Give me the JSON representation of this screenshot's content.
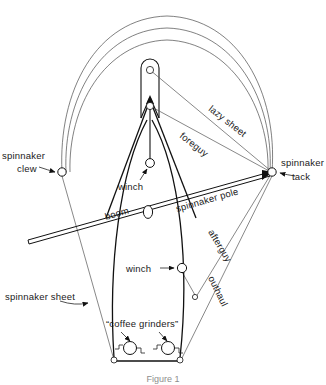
{
  "figure": {
    "caption": "Figure 1",
    "background_color": "#ffffff",
    "ink_color": "#111111",
    "line_color": "#555555"
  },
  "labels": {
    "spinnaker_clew": "spinnaker\nclew",
    "spinnaker_clew_line1": "spinnaker",
    "spinnaker_clew_line2": "clew",
    "spinnaker_tack_line1": "spinnaker",
    "spinnaker_tack_line2": "tack",
    "lazy_sheet": "lazy sheet",
    "foreguy": "foreguy",
    "winch_upper": "winch",
    "winch_lower": "winch",
    "boom": "boom",
    "spinnaker_pole": "spinnaker pole",
    "afterguy": "afterguy",
    "outhaul": "outhaul",
    "spinnaker_sheet": "spinnaker sheet",
    "coffee_grinders": "“coffee grinders”"
  },
  "nodes": [
    {
      "name": "spinnaker-clew-node",
      "x": 62,
      "y": 172,
      "r": 4.2
    },
    {
      "name": "spinnaker-tack-node",
      "x": 272,
      "y": 172,
      "r": 4.2
    },
    {
      "name": "mast-upper-ring",
      "x": 150,
      "y": 70,
      "r": 3.6
    },
    {
      "name": "mast-lower-ring",
      "x": 150,
      "y": 106,
      "r": 3.6
    },
    {
      "name": "winch-upper-node",
      "x": 150,
      "y": 163,
      "r": 4.4
    },
    {
      "name": "winch-lower-node",
      "x": 182,
      "y": 268,
      "r": 4.6
    },
    {
      "name": "lower-block-node",
      "x": 195,
      "y": 297,
      "r": 2.6
    },
    {
      "name": "hull-port-corner",
      "x": 114,
      "y": 360,
      "r": 3.0
    },
    {
      "name": "hull-starboard-corner",
      "x": 180,
      "y": 360,
      "r": 3.0
    },
    {
      "name": "mast-collar",
      "x": 148,
      "y": 212,
      "rx": 4.6,
      "ry": 6.4
    }
  ],
  "coffee_grinders": [
    {
      "name": "coffee-grinder-left",
      "x": 130,
      "y": 348,
      "r": 6.5
    },
    {
      "name": "coffee-grinder-right",
      "x": 168,
      "y": 348,
      "r": 6.5
    }
  ]
}
